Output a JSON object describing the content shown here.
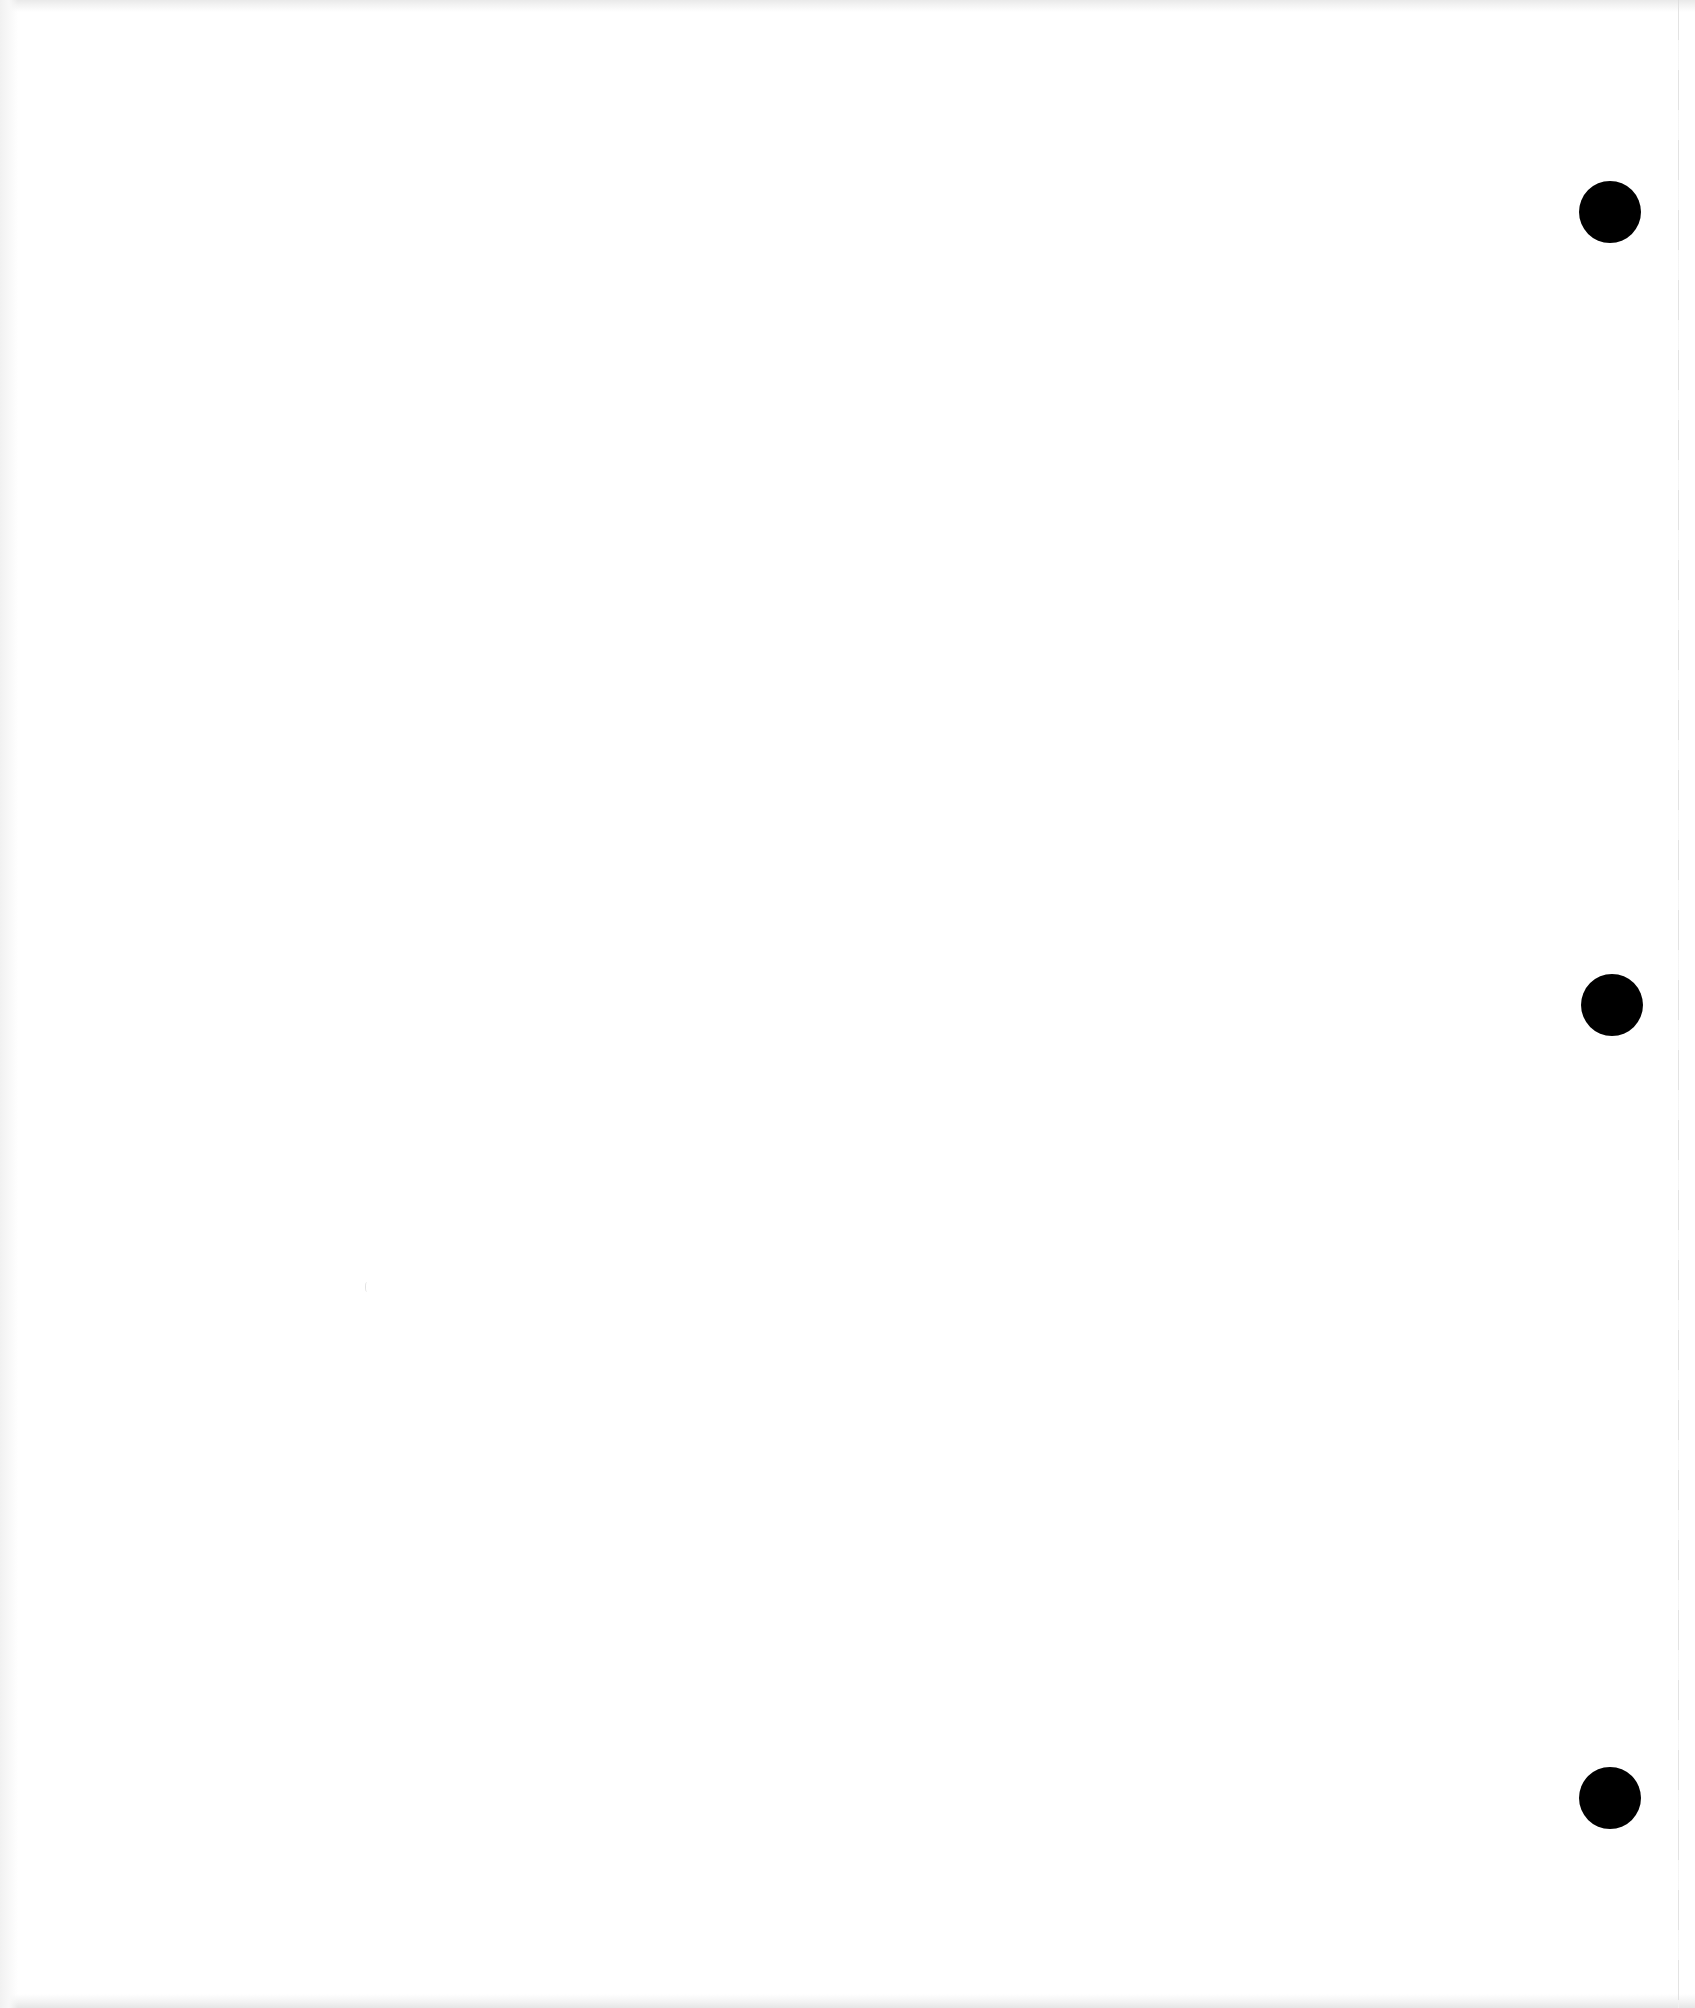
{
  "page": {
    "background": "#ffffff",
    "width": 1695,
    "height": 2008,
    "text_content": []
  },
  "punch_holes": [
    {
      "cx": 1610,
      "cy": 212,
      "diameter": 62,
      "color": "#000000"
    },
    {
      "cx": 1612,
      "cy": 1005,
      "diameter": 62,
      "color": "#000000"
    },
    {
      "cx": 1610,
      "cy": 1798,
      "diameter": 62,
      "color": "#000000"
    }
  ],
  "edge_line": {
    "x": 1678,
    "color": "#dcdcdc"
  }
}
